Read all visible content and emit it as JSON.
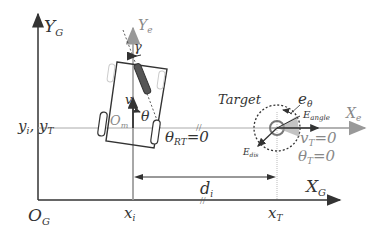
{
  "diagram": {
    "global_frame": {
      "y_axis_label": "Y",
      "y_axis_sub": "G",
      "x_axis_label": "X",
      "x_axis_sub": "G",
      "origin_label": "O",
      "origin_sub": "G"
    },
    "robot_frame": {
      "y_axis_label": "Y",
      "y_axis_sub": "e",
      "x_axis_label": "X",
      "x_axis_sub": "e",
      "origin_label": "O",
      "origin_sub": "m"
    },
    "robot": {
      "steer_angle_label": "γ",
      "velocity_label": "v",
      "heading_label": "θ",
      "relative_angle_label": "θ",
      "relative_angle_sub": "RT",
      "relative_angle_value": "=0"
    },
    "target": {
      "label": "Target",
      "error_theta_label": "e",
      "error_theta_sub": "θ",
      "angle_error_label": "E",
      "angle_error_sub": "angle",
      "dist_error_label": "E",
      "dist_error_sub": "dis",
      "velocity_label": "v",
      "velocity_sub": "T",
      "velocity_value": "=0",
      "heading_label": "θ",
      "heading_sub": "T",
      "heading_value": "=0"
    },
    "coordinates": {
      "y_label": "y",
      "y_i_sub": "i",
      "y_T_sub": "T",
      "x_i_label": "x",
      "x_i_sub": "i",
      "x_T_label": "x",
      "x_T_sub": "T",
      "distance_label": "d",
      "distance_sub": "i"
    },
    "colors": {
      "axis": "#333333",
      "robot_frame": "#999999",
      "guide": "#aaaaaa"
    }
  }
}
